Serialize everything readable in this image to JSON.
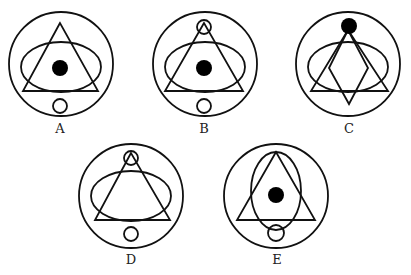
{
  "figure": {
    "type": "shape-pattern-options",
    "stroke_color": "#111111",
    "fill_color": "#000000",
    "options": [
      {
        "label": "A",
        "outer_circle": {
          "cx": 61,
          "cy": 64,
          "r": 52
        },
        "triangle": {
          "points": "60,23 23,91 98,91"
        },
        "ellipse": {
          "cx": 61,
          "cy": 67,
          "rx": 40,
          "ry": 25
        },
        "filled_dot": {
          "cx": 60,
          "cy": 68,
          "r": 8
        },
        "small_circles": [
          {
            "cx": 60,
            "cy": 106,
            "r": 7
          }
        ],
        "diamond": null,
        "label_pos": {
          "x": 60,
          "y": 129
        }
      },
      {
        "label": "B",
        "outer_circle": {
          "cx": 205,
          "cy": 64,
          "r": 52
        },
        "triangle": {
          "points": "204,23 165,91 243,91"
        },
        "ellipse": {
          "cx": 205,
          "cy": 67,
          "rx": 40,
          "ry": 25
        },
        "filled_dot": {
          "cx": 204,
          "cy": 68,
          "r": 8
        },
        "small_circles": [
          {
            "cx": 204,
            "cy": 27,
            "r": 7
          },
          {
            "cx": 204,
            "cy": 106,
            "r": 7
          }
        ],
        "diamond": null,
        "label_pos": {
          "x": 204,
          "y": 129
        }
      },
      {
        "label": "C",
        "outer_circle": {
          "cx": 348,
          "cy": 64,
          "r": 52
        },
        "triangle": {
          "points": "348,30 311,91 388,91"
        },
        "ellipse": {
          "cx": 348,
          "cy": 67,
          "rx": 40,
          "ry": 25
        },
        "filled_dot": {
          "cx": 349,
          "cy": 26,
          "r": 8
        },
        "small_circles": [],
        "diamond": {
          "points": "348,30 329,68 349,104 368,68"
        },
        "label_pos": {
          "x": 349,
          "y": 129
        }
      },
      {
        "label": "D",
        "outer_circle": {
          "cx": 131,
          "cy": 196,
          "r": 52
        },
        "triangle": {
          "points": "131,153 95,220 170,220"
        },
        "ellipse": {
          "cx": 131,
          "cy": 196,
          "rx": 40,
          "ry": 25
        },
        "filled_dot": null,
        "small_circles": [
          {
            "cx": 131,
            "cy": 158,
            "r": 7
          },
          {
            "cx": 131,
            "cy": 234,
            "r": 7
          }
        ],
        "diamond": null,
        "label_pos": {
          "x": 131,
          "y": 260
        }
      },
      {
        "label": "E",
        "outer_circle": {
          "cx": 276,
          "cy": 196,
          "r": 52
        },
        "triangle": {
          "points": "276,152 237,220 315,220"
        },
        "ellipse": {
          "cx": 276,
          "cy": 191,
          "rx": 25,
          "ry": 39
        },
        "filled_dot": {
          "cx": 276,
          "cy": 195,
          "r": 8
        },
        "small_circles": [
          {
            "cx": 276,
            "cy": 233,
            "r": 8
          }
        ],
        "diamond": null,
        "label_pos": {
          "x": 277,
          "y": 260
        }
      }
    ]
  }
}
